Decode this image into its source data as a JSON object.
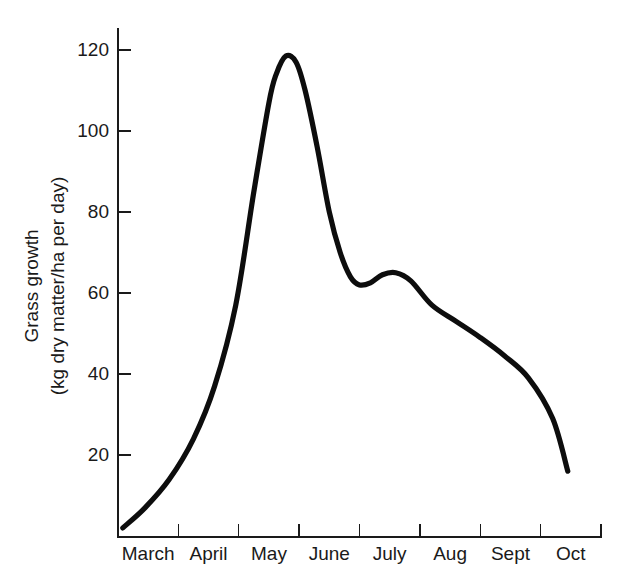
{
  "chart_data": {
    "type": "line",
    "title": "",
    "xlabel": "",
    "ylabel_line1": "Grass growth",
    "ylabel_line2": "(kg dry matter/ha per day)",
    "grid": false,
    "legend": "none",
    "ylim": [
      0,
      126
    ],
    "yticks": [
      20,
      40,
      60,
      80,
      100,
      120
    ],
    "ytick_labels": [
      "20",
      "40",
      "60",
      "80",
      "100",
      "120"
    ],
    "categories": [
      "March",
      "April",
      "May",
      "June",
      "July",
      "Aug",
      "Sept",
      "Oct"
    ],
    "x_tick_count": 9,
    "series": [
      {
        "name": "Grass growth",
        "color": "#0d0d0d",
        "x": [
          0.08,
          0.45,
          0.85,
          1.25,
          1.6,
          1.95,
          2.25,
          2.5,
          2.62,
          2.78,
          2.95,
          3.1,
          3.3,
          3.5,
          3.68,
          3.85,
          4.0,
          4.18,
          4.38,
          4.6,
          4.85,
          5.2,
          5.6,
          6.0,
          6.4,
          6.8,
          7.2,
          7.45
        ],
        "y": [
          2,
          7,
          14,
          24,
          37,
          57,
          85,
          107,
          114,
          118.5,
          117,
          110,
          96,
          80,
          70,
          64,
          62,
          62.5,
          64.5,
          65,
          63,
          57,
          53,
          49,
          44.5,
          39,
          29,
          16
        ],
        "peak_value": 118.5,
        "peak_month": "May",
        "local_min_value": 62,
        "local_min_month": "June",
        "secondary_peak_value": 65,
        "secondary_peak_month": "July",
        "start_value": 2,
        "end_value": 16
      }
    ]
  },
  "axis": {
    "y_title_line1": "Grass growth",
    "y_title_line2": "(kg dry matter/ha per day)"
  }
}
